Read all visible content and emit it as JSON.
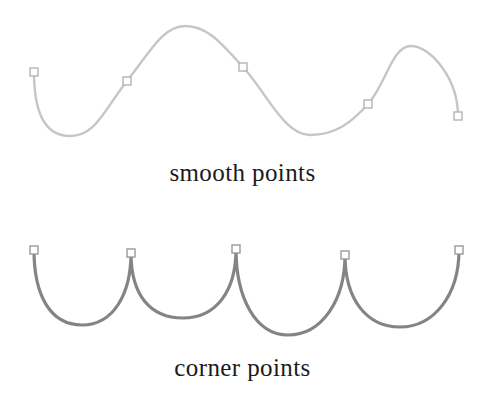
{
  "figure": {
    "background_color": "#ffffff"
  },
  "panels": [
    {
      "id": "smooth",
      "caption": "smooth points",
      "caption_color": "#1b1b1b",
      "stroke_color": "#c6c6c6",
      "stroke_width": 2.4,
      "anchor_fill": "#ffffff",
      "anchor_stroke": "#b4b4b4",
      "anchor_size": 8,
      "description": "Light gray continuous S-shaped wave where each anchor point has collinear direction handles, so the curve passes through smoothly without a cusp.",
      "anchors": [
        {
          "x": 34,
          "y": 72
        },
        {
          "x": 127,
          "y": 81
        },
        {
          "x": 243,
          "y": 67
        },
        {
          "x": 368,
          "y": 104
        },
        {
          "x": 458,
          "y": 116
        }
      ],
      "path": "M 34 72 C 34 110, 44 136, 70 136 C 96 136, 104 110, 127 81 C 150 52, 163 26, 185 26 C 208 26, 222 44, 243 67 C 266 92, 284 135, 310 135 C 336 135, 352 122, 368 104 C 386 84, 392 46, 411 46 C 430 46, 458 78, 458 116",
      "extrema": [
        {
          "kind": "valley",
          "x": 70,
          "y": 136
        },
        {
          "kind": "peak",
          "x": 185,
          "y": 26
        },
        {
          "kind": "valley",
          "x": 310,
          "y": 135
        },
        {
          "kind": "peak",
          "x": 411,
          "y": 46
        }
      ]
    },
    {
      "id": "corner",
      "caption": "corner points",
      "caption_color": "#1b1b1b",
      "stroke_color": "#848484",
      "stroke_width": 3.2,
      "anchor_fill": "#ffffff",
      "anchor_stroke": "#9a9a9a",
      "anchor_size": 8,
      "description": "Darker gray scalloped arcs where each anchor point is a cusp, so the curve changes direction abruptly at every point.",
      "anchors": [
        {
          "x": 34,
          "y": 45
        },
        {
          "x": 131,
          "y": 48
        },
        {
          "x": 236,
          "y": 44
        },
        {
          "x": 345,
          "y": 50
        },
        {
          "x": 459,
          "y": 45
        }
      ],
      "path": "M 34 45 C 34 90, 50 120, 82 120 C 114 120, 131 88, 131 48 C 131 90, 150 113, 183 113 C 217 113, 236 85, 236 44 C 236 92, 255 130, 288 130 C 322 130, 345 95, 345 50 C 345 95, 367 122, 400 122 C 434 122, 459 90, 459 45",
      "extrema": [
        {
          "kind": "valley",
          "x": 82,
          "y": 120
        },
        {
          "kind": "valley",
          "x": 183,
          "y": 113
        },
        {
          "kind": "valley",
          "x": 288,
          "y": 130
        },
        {
          "kind": "valley",
          "x": 400,
          "y": 122
        }
      ]
    }
  ]
}
